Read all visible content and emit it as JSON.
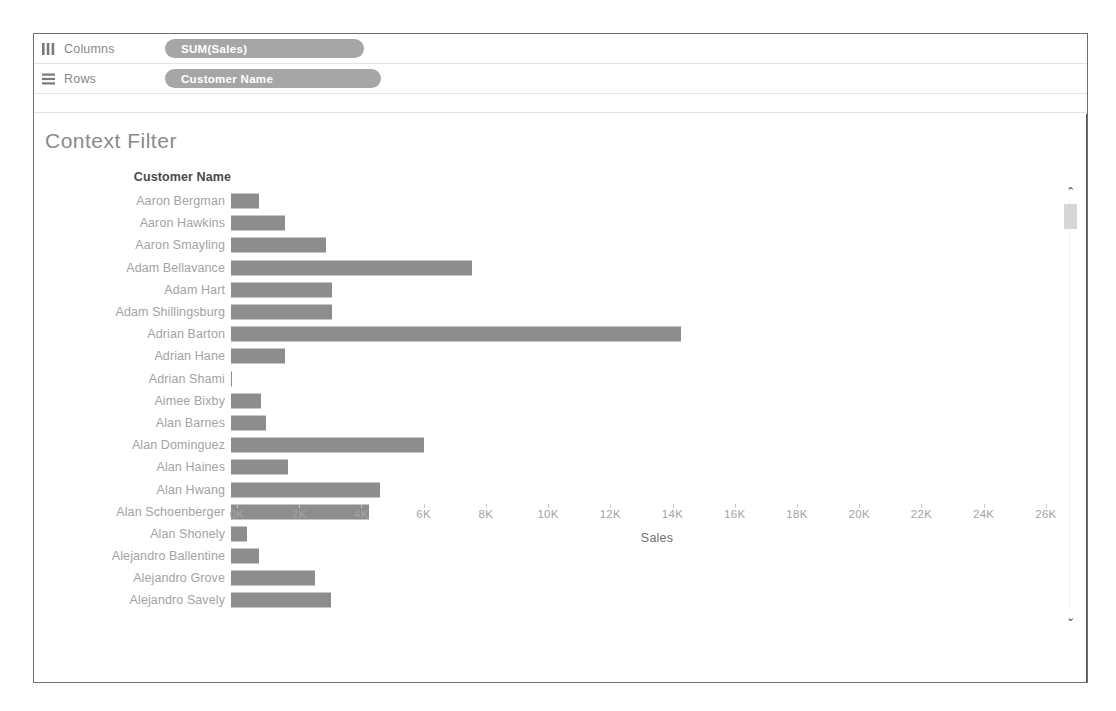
{
  "shelves": [
    {
      "icon": "columns-icon",
      "label": "Columns",
      "pill": "SUM(Sales)"
    },
    {
      "icon": "rows-icon",
      "label": "Rows",
      "pill": "Customer Name"
    }
  ],
  "viz": {
    "title": "Context Filter",
    "row_header_caption": "Customer Name",
    "axis_title": "Sales"
  },
  "scrollbar": {
    "up_arrow": "⌃",
    "down_arrow": "⌄"
  },
  "colors": {
    "bar": "#8d8d8d",
    "pill": "#a6a6a6",
    "label_text": "#a3a3a3",
    "header_text": "#4b4b4b",
    "title_text": "#8a8a8a",
    "frame_border": "#6e6e6e"
  },
  "chart_data": {
    "type": "bar",
    "orientation": "horizontal",
    "title": "Context Filter",
    "xlabel": "Sales",
    "ylabel": "Customer Name",
    "xlim": [
      0,
      27000
    ],
    "xticks": [
      0,
      2000,
      4000,
      6000,
      8000,
      10000,
      12000,
      14000,
      16000,
      18000,
      20000,
      22000,
      24000,
      26000
    ],
    "xticklabels": [
      "0K",
      "2K",
      "4K",
      "6K",
      "8K",
      "10K",
      "12K",
      "14K",
      "16K",
      "18K",
      "20K",
      "22K",
      "24K",
      "26K"
    ],
    "grid": false,
    "legend": false,
    "categories": [
      "Aaron Bergman",
      "Aaron Hawkins",
      "Aaron Smayling",
      "Adam Bellavance",
      "Adam Hart",
      "Adam Shillingsburg",
      "Adrian Barton",
      "Adrian Hane",
      "Adrian Shami",
      "Aimee Bixby",
      "Alan Barnes",
      "Alan Dominguez",
      "Alan Haines",
      "Alan Hwang",
      "Alan Schoenberger",
      "Alan Shonely",
      "Alejandro Ballentine",
      "Alejandro Grove",
      "Alejandro Savely"
    ],
    "values": [
      886,
      1744,
      3050,
      7756,
      3250,
      3250,
      14474,
      1736,
      58,
      967,
      1113,
      6206,
      1841,
      4805,
      4428,
      506,
      890,
      2700,
      3200
    ],
    "series": [
      {
        "name": "SUM(Sales)",
        "values": [
          886,
          1744,
          3050,
          7756,
          3250,
          3250,
          14474,
          1736,
          58,
          967,
          1113,
          6206,
          1841,
          4805,
          4428,
          506,
          890,
          2700,
          3200
        ]
      }
    ]
  }
}
